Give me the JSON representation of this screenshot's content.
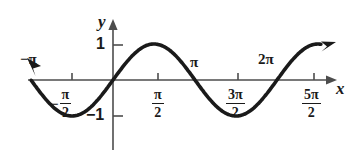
{
  "figure": {
    "kind": "sine-curve-graph",
    "background_color": "#ffffff",
    "curve_color": "#1a1a1a",
    "axis_color": "#4d4d4d"
  },
  "axes": {
    "y_axis_label": "y",
    "x_axis_label": "x",
    "y_ticks": [
      {
        "label": "1",
        "value": 1
      },
      {
        "label": "−1",
        "value": -1
      }
    ],
    "x_ticks": [
      {
        "label": "−π",
        "value": -3.1416,
        "position": "above-left"
      },
      {
        "label": "−π/2",
        "numerator": "−π",
        "denominator": "2",
        "value": -1.5708,
        "position": "below"
      },
      {
        "label": "π/2",
        "numerator": "π",
        "denominator": "2",
        "value": 1.5708,
        "position": "below"
      },
      {
        "label": "π",
        "value": 3.1416,
        "position": "above"
      },
      {
        "label": "3π/2",
        "numerator": "3π",
        "denominator": "2",
        "value": 4.7124,
        "position": "below"
      },
      {
        "label": "2π",
        "value": 6.2832,
        "position": "above"
      },
      {
        "label": "5π/2",
        "numerator": "5π",
        "denominator": "2",
        "value": 7.854,
        "position": "below"
      }
    ]
  },
  "labels": {
    "minus_pi": "−π",
    "pi": "π",
    "two_pi": "2π",
    "one": "1",
    "minus_one": "−1",
    "minus_sign": "−",
    "y": "y",
    "x": "x",
    "frac_minus_pi_over_2": {
      "num": "π",
      "den": "2"
    },
    "frac_pi_over_2": {
      "num": "π",
      "den": "2"
    },
    "frac_3pi_over_2": {
      "num": "3π",
      "den": "2"
    },
    "frac_5pi_over_2": {
      "num": "5π",
      "den": "2"
    }
  },
  "chart_data": {
    "type": "line",
    "title": "",
    "xlabel": "x",
    "ylabel": "y",
    "function": "y = sin(x)",
    "xlim": [
      -3.927,
      8.2
    ],
    "ylim": [
      -1.55,
      1.55
    ],
    "grid": false,
    "legend": null,
    "arrows": {
      "start": "left-up",
      "end": "right-up"
    },
    "xtick_values": [
      -3.1416,
      -1.5708,
      1.5708,
      3.1416,
      4.7124,
      6.2832,
      7.854
    ],
    "xtick_labels": [
      "−π",
      "−π/2",
      "π/2",
      "π",
      "3π/2",
      "2π",
      "5π/2"
    ],
    "ytick_values": [
      1,
      -1
    ],
    "ytick_labels": [
      "1",
      "−1"
    ],
    "series": [
      {
        "name": "sin(x)",
        "x": [
          -3.56,
          -3.14,
          -2.75,
          -2.36,
          -1.96,
          -1.571,
          -1.18,
          -0.785,
          -0.39,
          0,
          0.39,
          0.785,
          1.18,
          1.571,
          1.96,
          2.36,
          2.75,
          3.1416,
          3.53,
          3.93,
          4.32,
          4.712,
          5.11,
          5.5,
          5.89,
          6.2832,
          6.68,
          7.07,
          7.46,
          7.854,
          8.2
        ],
        "y": [
          0.406,
          0,
          -0.382,
          -0.707,
          -0.924,
          -1,
          -0.925,
          -0.707,
          -0.38,
          0,
          0.38,
          0.707,
          0.925,
          1,
          0.924,
          0.707,
          0.382,
          0,
          -0.381,
          -0.707,
          -0.925,
          -1,
          -0.925,
          -0.706,
          -0.382,
          0,
          0.384,
          0.707,
          0.925,
          1,
          0.951
        ]
      }
    ]
  }
}
